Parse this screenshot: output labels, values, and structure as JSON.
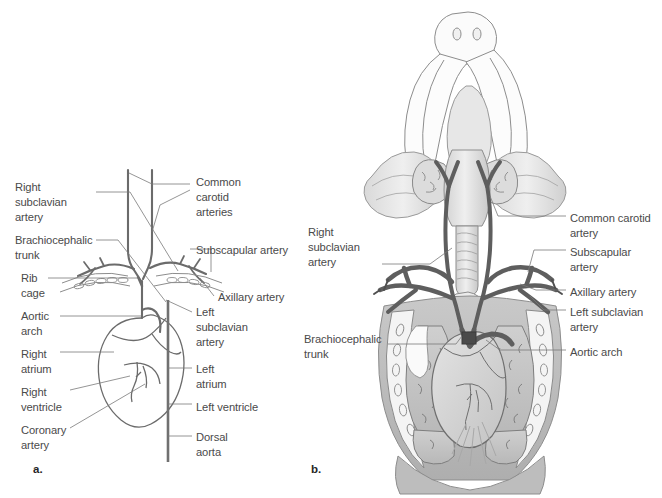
{
  "figure": {
    "background_color": "#ffffff",
    "text_color": "#4a4a4a",
    "vessel_color": "#6b6b6b",
    "leader_line_color": "#777777"
  },
  "panel_a": {
    "letter": "a.",
    "caption": "Schematic diagram of anterior arteries",
    "labels_left": [
      {
        "id": "right-subclavian-artery",
        "text": "Right\nsubclavian\nartery",
        "x": 15,
        "y": 180
      },
      {
        "id": "brachiocephalic-trunk",
        "text": "Brachiocephalic\ntrunk",
        "x": 15,
        "y": 233
      },
      {
        "id": "rib-cage",
        "text": "Rib\ncage",
        "x": 21,
        "y": 271
      },
      {
        "id": "aortic-arch",
        "text": "Aortic\narch",
        "x": 21,
        "y": 309
      },
      {
        "id": "right-atrium",
        "text": "Right\natrium",
        "x": 21,
        "y": 347
      },
      {
        "id": "right-ventricle",
        "text": "Right\nventricle",
        "x": 21,
        "y": 385
      },
      {
        "id": "coronary-artery",
        "text": "Coronary\nartery",
        "x": 21,
        "y": 423
      }
    ],
    "labels_right": [
      {
        "id": "common-carotid-arteries",
        "text": "Common\ncarotid\narteries",
        "x": 196,
        "y": 175
      },
      {
        "id": "subscapular-artery",
        "text": "Subscapular artery",
        "x": 196,
        "y": 243
      },
      {
        "id": "axillary-artery",
        "text": "Axillary artery",
        "x": 218,
        "y": 290
      },
      {
        "id": "left-subclavian-artery",
        "text": "Left\nsubclavian\nartery",
        "x": 196,
        "y": 305
      },
      {
        "id": "left-atrium",
        "text": "Left\natrium",
        "x": 196,
        "y": 362
      },
      {
        "id": "left-ventricle",
        "text": "Left ventricle",
        "x": 196,
        "y": 400
      },
      {
        "id": "dorsal-aorta",
        "text": "Dorsal\naorta",
        "x": 196,
        "y": 430
      }
    ]
  },
  "panel_b": {
    "letter": "b.",
    "caption": "Ventral dissection view of thorax and neck",
    "labels_left": [
      {
        "id": "right-subclavian-artery",
        "text": "Right\nsubclavian\nartery",
        "x": 308,
        "y": 225
      },
      {
        "id": "brachiocephalic-trunk",
        "text": "Brachiocephalic\ntrunk",
        "x": 304,
        "y": 332
      }
    ],
    "labels_right": [
      {
        "id": "common-carotid-artery",
        "text": "Common carotid\nartery",
        "x": 570,
        "y": 211
      },
      {
        "id": "subscapular-artery",
        "text": "Subscapular\nartery",
        "x": 570,
        "y": 245
      },
      {
        "id": "axillary-artery",
        "text": "Axillary artery",
        "x": 570,
        "y": 285
      },
      {
        "id": "left-subclavian-artery",
        "text": "Left subclavian\nartery",
        "x": 570,
        "y": 305
      },
      {
        "id": "aortic-arch",
        "text": "Aortic arch",
        "x": 570,
        "y": 345
      }
    ]
  }
}
